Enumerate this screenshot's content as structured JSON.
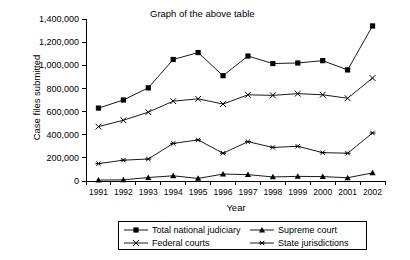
{
  "chart_data": {
    "type": "line",
    "title": "Graph of the above table",
    "xlabel": "Year",
    "ylabel": "Case files submitted",
    "categories": [
      "1991",
      "1992",
      "1993",
      "1994",
      "1995",
      "1996",
      "1997",
      "1998",
      "1999",
      "2000",
      "2001",
      "2002"
    ],
    "ylim": [
      0,
      1400000
    ],
    "ytick_values": [
      0,
      200000,
      400000,
      600000,
      800000,
      1000000,
      1200000,
      1400000
    ],
    "ytick_labels": [
      "0",
      "200,000",
      "400,000",
      "600,000",
      "800,000",
      "1,000,000",
      "1,200,000",
      "1,400,000"
    ],
    "grid": false,
    "legend_position": "below-axis",
    "series": [
      {
        "name": "Total national judiciary",
        "marker": "filled-square",
        "values": [
          630000,
          700000,
          805000,
          1050000,
          1110000,
          910000,
          1080000,
          1015000,
          1020000,
          1040000,
          960000,
          1340000
        ]
      },
      {
        "name": "Federal courts",
        "marker": "x-cross",
        "values": [
          470000,
          525000,
          595000,
          690000,
          710000,
          665000,
          745000,
          740000,
          755000,
          745000,
          715000,
          890000
        ]
      },
      {
        "name": "Supreme court",
        "marker": "filled-triangle",
        "values": [
          8000,
          10000,
          30000,
          45000,
          22000,
          60000,
          55000,
          35000,
          40000,
          38000,
          28000,
          70000
        ]
      },
      {
        "name": "State jurisdictions",
        "marker": "asterisk",
        "values": [
          150000,
          180000,
          190000,
          325000,
          355000,
          240000,
          340000,
          290000,
          300000,
          245000,
          240000,
          415000
        ]
      }
    ]
  },
  "legend": {
    "entries": [
      {
        "label": "Total national judiciary",
        "marker": "filled-square"
      },
      {
        "label": "Federal courts",
        "marker": "x-cross"
      },
      {
        "label": "Supreme court",
        "marker": "filled-triangle"
      },
      {
        "label": "State jurisdictions",
        "marker": "asterisk"
      }
    ]
  },
  "colors": {
    "line": "#000000",
    "marker": "#000000",
    "background": "#ffffff",
    "axis": "#000000"
  }
}
